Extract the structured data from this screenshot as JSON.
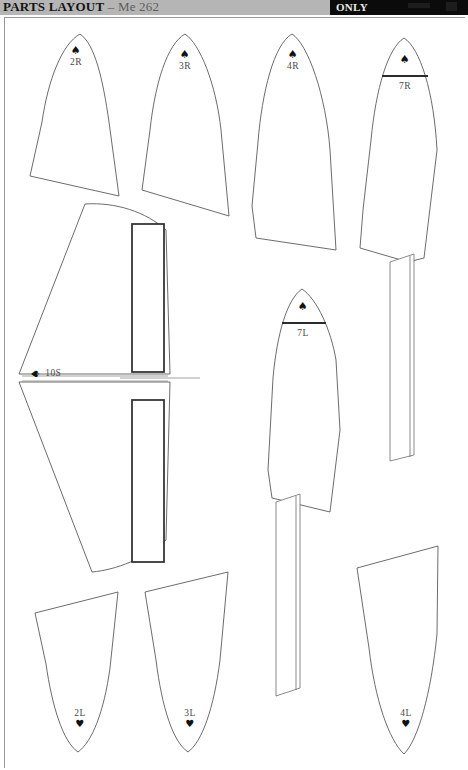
{
  "header": {
    "title_strong": "PARTS LAYOUT",
    "title_light": "– Me 262",
    "black_badge_label": "ONLY"
  },
  "sheet": {
    "background_color": "#ffffff",
    "outline_color": "#5b5b5b",
    "spar_color": "#2b2b2b",
    "header_gray": "#b5b5b5",
    "badge_black": "#0b0b0b"
  },
  "parts": [
    {
      "id": "2R",
      "label": "2R",
      "suit": "♠",
      "suit_name": "spade-icon",
      "suit_position": "above",
      "orientation": "point-up"
    },
    {
      "id": "3R",
      "label": "3R",
      "suit": "♠",
      "suit_name": "spade-icon",
      "suit_position": "above",
      "orientation": "point-up"
    },
    {
      "id": "4R",
      "label": "4R",
      "suit": "♠",
      "suit_name": "spade-icon",
      "suit_position": "above",
      "orientation": "point-up"
    },
    {
      "id": "7R",
      "label": "7R",
      "suit": "♠",
      "suit_name": "spade-icon",
      "suit_position": "above",
      "orientation": "point-up"
    },
    {
      "id": "10S",
      "label": "10S",
      "suit": "♠",
      "suit_name": "spade-icon",
      "suit_position": "left",
      "orientation": "horizontal"
    },
    {
      "id": "7L",
      "label": "7L",
      "suit": "♠",
      "suit_name": "spade-icon",
      "suit_position": "above",
      "orientation": "point-up"
    },
    {
      "id": "2L",
      "label": "2L",
      "suit": "♥",
      "suit_name": "heart-icon",
      "suit_position": "below",
      "orientation": "point-down"
    },
    {
      "id": "3L",
      "label": "3L",
      "suit": "♥",
      "suit_name": "heart-icon",
      "suit_position": "below",
      "orientation": "point-down"
    },
    {
      "id": "4L",
      "label": "4L",
      "suit": "♥",
      "suit_name": "heart-icon",
      "suit_position": "below",
      "orientation": "point-down"
    }
  ]
}
